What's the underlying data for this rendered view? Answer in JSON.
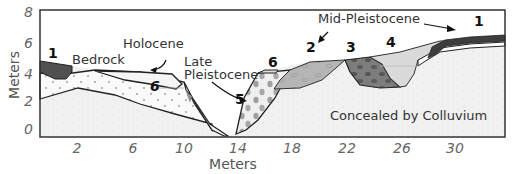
{
  "figure": {
    "y_axis": {
      "title": "Meters",
      "ticks": [
        "8",
        "6",
        "4",
        "2",
        "0"
      ]
    },
    "x_axis": {
      "title": "Meters",
      "ticks": [
        "2",
        "6",
        "10",
        "14",
        "18",
        "22",
        "26",
        "30"
      ]
    },
    "labels": {
      "bedrock": "Bedrock",
      "holocene": "Holocene",
      "late_pleistocene_line1": "Late",
      "late_pleistocene_line2": "Pleistocene",
      "mid_pleistocene": "Mid-Pleistocene",
      "colluvium": "Concealed by Colluvium"
    },
    "units": {
      "u1_left": "1",
      "u1_right": "1",
      "u2": "2",
      "u3": "3",
      "u4": "4",
      "u5": "5",
      "u6_left": "6",
      "u6_mid": "6"
    },
    "colors": {
      "unit1": "#555555",
      "unit2": "#b3b3b3",
      "unit3": "#7a7a7a",
      "unit4": "#d8d8d8",
      "unit5_clasts": "#999999",
      "colluvium": "#f2f2f2",
      "frame": "#333333"
    }
  }
}
